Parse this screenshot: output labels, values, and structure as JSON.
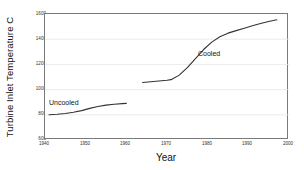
{
  "chart_data": {
    "type": "line",
    "title": "",
    "xlabel": "Year",
    "ylabel": "Turbine Inlet Temperature  C",
    "xlim": [
      1940,
      2000
    ],
    "ylim": [
      600,
      1600
    ],
    "xticks": [
      1940,
      1950,
      1960,
      1970,
      1980,
      1990,
      2000
    ],
    "yticks": [
      600,
      800,
      1000,
      1200,
      1400,
      1600
    ],
    "grid": "horizontal",
    "legend_position": "inline-annotations",
    "line_color": "#333333",
    "grid_color": "#e3e3e3",
    "frame_color": "#7a7a7a",
    "series": [
      {
        "name": "Uncooled",
        "annotation": "Uncooled",
        "points": [
          [
            1941,
            800
          ],
          [
            1943,
            804
          ],
          [
            1945,
            810
          ],
          [
            1947,
            820
          ],
          [
            1949,
            833
          ],
          [
            1951,
            851
          ],
          [
            1953,
            866
          ],
          [
            1955,
            877
          ],
          [
            1957,
            884
          ],
          [
            1959,
            889
          ],
          [
            1960,
            891
          ]
        ]
      },
      {
        "name": "Cooled",
        "annotation": "Cooled",
        "points": [
          [
            1964,
            1056
          ],
          [
            1966,
            1062
          ],
          [
            1968,
            1068
          ],
          [
            1970,
            1074
          ],
          [
            1971,
            1079
          ],
          [
            1973,
            1115
          ],
          [
            1975,
            1175
          ],
          [
            1977,
            1245
          ],
          [
            1979,
            1318
          ],
          [
            1981,
            1377
          ],
          [
            1983,
            1420
          ],
          [
            1985,
            1448
          ],
          [
            1987,
            1468
          ],
          [
            1989,
            1487
          ],
          [
            1991,
            1506
          ],
          [
            1993,
            1524
          ],
          [
            1995,
            1541
          ],
          [
            1997,
            1554
          ]
        ]
      }
    ]
  },
  "axes": {
    "ylabel_text": "Turbine Inlet Temperature  C",
    "xlabel_text": "Year",
    "ytick_labels": [
      "1600",
      "1400",
      "1200",
      "1000",
      "800",
      "600"
    ],
    "xtick_labels": [
      "1940",
      "1950",
      "1960",
      "1970",
      "1980",
      "1990",
      "2000"
    ]
  },
  "annotations": {
    "uncooled": "Uncooled",
    "cooled": "Cooled"
  }
}
